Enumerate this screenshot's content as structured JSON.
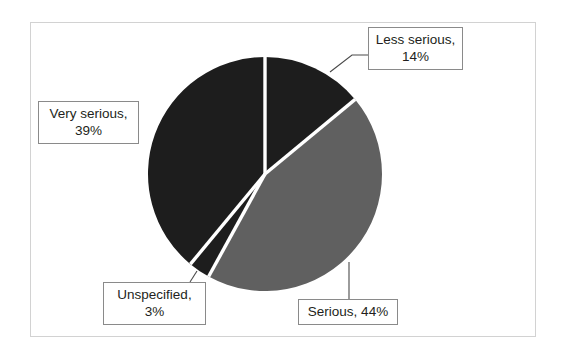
{
  "chart_data": {
    "type": "pie",
    "title": "",
    "categories": [
      "Less serious",
      "Serious",
      "Unspecified",
      "Very serious"
    ],
    "values": [
      14,
      44,
      3,
      39
    ],
    "value_unit": "%",
    "labels": [
      {
        "name": "less-serious",
        "line1": "Less serious,",
        "line2": "14%",
        "value": 14,
        "color": "#1d1d1d"
      },
      {
        "name": "serious",
        "line1": "Serious, 44%",
        "line2": "",
        "value": 44,
        "color": "#606060"
      },
      {
        "name": "unspecified",
        "line1": "Unspecified,",
        "line2": "3%",
        "value": 3,
        "color": "#1d1d1d"
      },
      {
        "name": "very-serious",
        "line1": "Very serious,",
        "line2": "39%",
        "value": 39,
        "color": "#1d1d1d"
      }
    ],
    "colors": {
      "dark_slice": "#1d1d1d",
      "gray_slice": "#606060",
      "separator": "#ffffff",
      "leader_line": "#4a4a4a",
      "label_border": "#8a8a8a",
      "frame_border": "#d2d2d2",
      "background": "#ffffff"
    },
    "legend_position": "none",
    "grid": false,
    "start_angle_deg": 0,
    "direction": "clockwise",
    "geometry": {
      "cx": 265,
      "cy": 174,
      "r": 117
    }
  },
  "figure": {
    "frame": {
      "x": 30,
      "y": 22,
      "width": 506,
      "height": 315
    }
  }
}
